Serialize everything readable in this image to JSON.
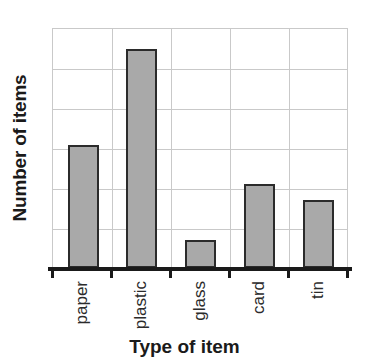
{
  "chart_data": {
    "type": "bar",
    "title": "",
    "xlabel": "Type of item",
    "ylabel": "Number of items",
    "categories": [
      "paper",
      "plastic",
      "glass",
      "card",
      "tin"
    ],
    "values": [
      3.1,
      5.5,
      0.7,
      2.1,
      1.7
    ],
    "ylim": [
      0,
      6
    ],
    "yticks": [
      0,
      1,
      2,
      3,
      4,
      5,
      6
    ],
    "ytick_labels": [
      "",
      "",
      "",
      "",
      "",
      "",
      ""
    ],
    "grid": true,
    "legend": null,
    "series": [
      {
        "name": "Number of items",
        "values": [
          3.1,
          5.5,
          0.7,
          2.1,
          1.7
        ]
      }
    ],
    "bar_color": "#a9a9a9",
    "bar_edge_color": "#2b2b2b",
    "grid_color": "#c9c9c9",
    "axis_color": "#1a1a1a"
  }
}
